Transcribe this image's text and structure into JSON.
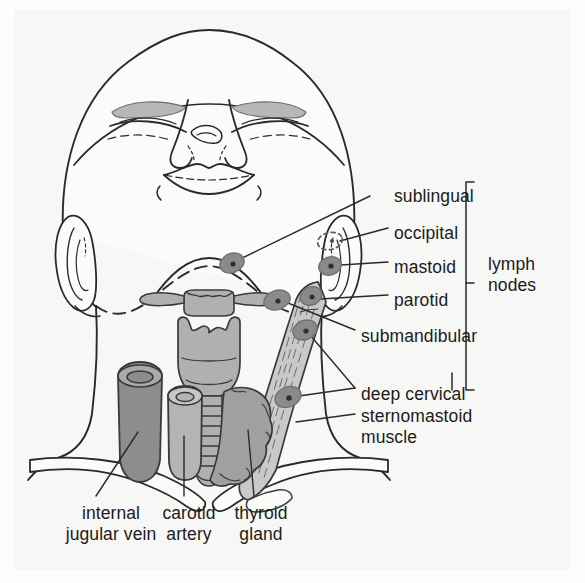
{
  "figure": {
    "view": "anterior view of head and neck"
  },
  "colors": {
    "background": "#f7f7f6",
    "page": "#fdfdfd",
    "ink": "#1b1b1b",
    "outline": "#2a2a2a",
    "node_fill": "#8a8a8a",
    "node_edge": "#6f6f6f",
    "node_core": "#2e2e2e",
    "vein_fill": "#8d8d8d",
    "artery_fill": "#b4b4b4",
    "thyroid_fill": "#a0a0a0",
    "cartilage_fill": "#b0b0b0",
    "muscle_fill": "#c9c9c9",
    "eyebrow_fill": "#b7b7b7",
    "bone_fill": "#fbfbfa"
  },
  "labels": {
    "lymph_nodes": [
      {
        "id": "sublingual",
        "text": "sublingual",
        "x": 394,
        "y": 187
      },
      {
        "id": "occipital",
        "text": "occipital",
        "x": 394,
        "y": 224
      },
      {
        "id": "mastoid",
        "text": "mastoid",
        "x": 394,
        "y": 258
      },
      {
        "id": "parotid",
        "text": "parotid",
        "x": 394,
        "y": 291
      },
      {
        "id": "submandibular",
        "text": "submandibular",
        "x": 361,
        "y": 327
      },
      {
        "id": "deep-cervical",
        "text": "deep cervical",
        "x": 361,
        "y": 385
      }
    ],
    "group": {
      "id": "lymph-nodes-group",
      "line1": "lymph",
      "line2": "nodes",
      "x": 494,
      "y": 277
    },
    "muscle": {
      "id": "sternomastoid-muscle",
      "line1": "sternomastoid",
      "line2": "muscle",
      "x": 361,
      "y": 411
    },
    "bottom": [
      {
        "id": "internal-jugular-vein",
        "line1": "internal",
        "line2": "jugular vein",
        "x": 110,
        "y": 512
      },
      {
        "id": "carotid-artery",
        "line1": "carotid",
        "line2": "artery",
        "x": 190,
        "y": 512
      },
      {
        "id": "thyroid-gland",
        "line1": "thyroid",
        "line2": "gland",
        "x": 260,
        "y": 512
      }
    ]
  },
  "structures": {
    "head": "skull and face outline, anterior view",
    "eyebrows": 2,
    "eyes": "closed, 2",
    "nose": "nostrils visible from below",
    "lips": "upper and lower lip",
    "ears": "left ear outline, right ear outline",
    "jaw_line": "dashed mandible outline",
    "hyoid": "hyoid bone with greater horns",
    "thyroid_cartilage": "laryngeal prominence",
    "cricoid": "cricoid cartilage",
    "trachea_rings": 7,
    "clavicles": 2,
    "sternomastoid": "right sternocleidomastoid muscle with striations",
    "thyroid_gland": "lobulated gland beside trachea",
    "internal_jugular_vein": "cut tube, darker shading",
    "carotid_artery": "cut tube, lighter shading"
  },
  "lymph_node_markers": [
    {
      "id": "sublingual-node",
      "cx": 232,
      "cy": 263,
      "rx": 12,
      "ry": 9,
      "rot": -22,
      "style": "solid"
    },
    {
      "id": "occipital-node",
      "cx": 330,
      "cy": 241,
      "rx": 12,
      "ry": 8,
      "rot": -12,
      "style": "dashed"
    },
    {
      "id": "mastoid-node",
      "cx": 330,
      "cy": 266,
      "rx": 11,
      "ry": 9,
      "rot": -18,
      "style": "solid"
    },
    {
      "id": "parotid-node",
      "cx": 311,
      "cy": 296,
      "rx": 11,
      "ry": 9,
      "rot": -25,
      "style": "solid"
    },
    {
      "id": "submandibular-node",
      "cx": 277,
      "cy": 300,
      "rx": 13,
      "ry": 9,
      "rot": -18,
      "style": "solid"
    },
    {
      "id": "deep-cervical-node-1",
      "cx": 305,
      "cy": 330,
      "rx": 12,
      "ry": 9,
      "rot": -22,
      "style": "solid"
    },
    {
      "id": "deep-cervical-node-2",
      "cx": 288,
      "cy": 397,
      "rx": 13,
      "ry": 10,
      "rot": -22,
      "style": "solid"
    }
  ]
}
